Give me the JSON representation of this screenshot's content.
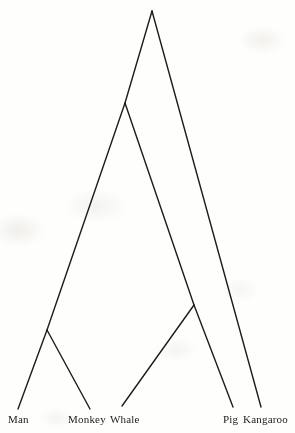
{
  "figure": {
    "type": "phylogenetic-tree",
    "style": "cladogram",
    "background_color": "#fefefd",
    "line_color": "#1c1c1c",
    "label_color": "#1b1b1b",
    "line_width": 1.4,
    "width": 295,
    "height": 433
  },
  "chart_data": {
    "type": "diagram",
    "subtype": "phylogenetic-cladogram",
    "title": "",
    "xlabel": "",
    "ylabel": "",
    "taxa": [
      "Man",
      "Monkey",
      "Whale",
      "Pig",
      "Kangaroo"
    ],
    "nodes": [
      {
        "id": "root",
        "label": "",
        "x": 152,
        "y": 11
      },
      {
        "id": "placental",
        "label": "",
        "x": 125,
        "y": 103
      },
      {
        "id": "primates",
        "label": "",
        "x": 47,
        "y": 330
      },
      {
        "id": "cetartiodactyla",
        "label": "",
        "x": 194,
        "y": 305
      },
      {
        "id": "man",
        "label": "Man",
        "x": 18,
        "y": 409
      },
      {
        "id": "monkey",
        "label": "Monkey",
        "x": 90,
        "y": 409
      },
      {
        "id": "whale",
        "label": "Whale",
        "x": 122,
        "y": 406
      },
      {
        "id": "pig",
        "label": "Pig",
        "x": 233,
        "y": 407
      },
      {
        "id": "kangaroo",
        "label": "Kangaroo",
        "x": 261,
        "y": 407
      }
    ],
    "edges": [
      {
        "from": "root",
        "to": "placental"
      },
      {
        "from": "root",
        "to": "kangaroo"
      },
      {
        "from": "placental",
        "to": "primates"
      },
      {
        "from": "placental",
        "to": "cetartiodactyla"
      },
      {
        "from": "primates",
        "to": "man"
      },
      {
        "from": "primates",
        "to": "monkey"
      },
      {
        "from": "cetartiodactyla",
        "to": "whale"
      },
      {
        "from": "cetartiodactyla",
        "to": "pig"
      }
    ]
  },
  "labels": [
    {
      "name": "tip-label-man",
      "text": "Man",
      "x": 8,
      "y": 414
    },
    {
      "name": "tip-label-monkey",
      "text": "Monkey",
      "x": 68,
      "y": 414
    },
    {
      "name": "tip-label-whale",
      "text": "Whale",
      "x": 110,
      "y": 414
    },
    {
      "name": "tip-label-pig",
      "text": "Pig",
      "x": 223,
      "y": 414
    },
    {
      "name": "tip-label-kangaroo",
      "text": "Kangaroo",
      "x": 243,
      "y": 414
    }
  ]
}
